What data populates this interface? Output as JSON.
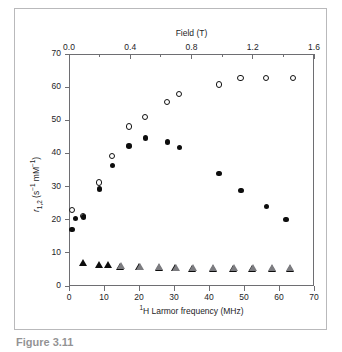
{
  "figure": {
    "caption": "Figure 3.11"
  },
  "chart_data": {
    "type": "scatter",
    "title": "",
    "xlabel": "¹H Larmor frequency (MHz)",
    "ylabel": "r₁,₂ (s⁻¹ mM⁻¹)",
    "top_axis_label": "Field (T)",
    "xlim": [
      0,
      70
    ],
    "ylim": [
      0,
      70
    ],
    "top_xlim": [
      0.0,
      1.6
    ],
    "xticks": [
      0,
      10,
      20,
      30,
      40,
      50,
      60,
      70
    ],
    "xtick_labels": [
      "0",
      "10",
      "20",
      "30",
      "40",
      "50",
      "60",
      "70"
    ],
    "yticks": [
      0,
      10,
      20,
      30,
      40,
      50,
      60,
      70
    ],
    "ytick_labels": [
      "0",
      "10",
      "20",
      "30",
      "40",
      "50",
      "60",
      "70"
    ],
    "top_xticks": [
      0.0,
      0.4,
      0.8,
      1.2,
      1.6
    ],
    "top_xtick_labels": [
      "0.0",
      "0.4",
      "0.8",
      "1.2",
      "1.6"
    ],
    "top_minor_xticks": [
      0.2,
      0.6,
      1.0,
      1.4
    ],
    "grid": false,
    "legend": "none",
    "series": [
      {
        "name": "open-circles",
        "marker": "open circle",
        "color": "#111111",
        "points": [
          [
            0.9,
            23.0
          ],
          [
            3.9,
            21.0
          ],
          [
            8.6,
            31.2
          ],
          [
            12.3,
            39.3
          ],
          [
            17.1,
            48.1
          ],
          [
            21.7,
            50.9
          ],
          [
            28.0,
            55.6
          ],
          [
            31.5,
            57.9
          ],
          [
            42.8,
            60.8
          ],
          [
            49.0,
            62.8
          ],
          [
            56.3,
            62.8
          ],
          [
            64.1,
            62.8
          ]
        ]
      },
      {
        "name": "filled-circles",
        "marker": "filled circle",
        "color": "#0d0d0d",
        "points": [
          [
            0.9,
            17.0
          ],
          [
            1.8,
            20.4
          ],
          [
            4.1,
            20.8
          ],
          [
            8.7,
            29.3
          ],
          [
            12.4,
            36.3
          ],
          [
            17.2,
            42.2
          ],
          [
            21.8,
            44.6
          ],
          [
            28.1,
            43.5
          ],
          [
            31.6,
            41.8
          ],
          [
            42.9,
            34.0
          ],
          [
            49.1,
            28.8
          ],
          [
            56.4,
            24.0
          ],
          [
            62.0,
            20.1
          ]
        ]
      },
      {
        "name": "filled-triangles",
        "marker": "filled triangle",
        "color": "#0d0d0d",
        "points": [
          [
            4.0,
            7.2
          ],
          [
            8.6,
            6.6
          ],
          [
            11.2,
            6.6
          ],
          [
            14.6,
            6.0
          ],
          [
            20.1,
            5.8
          ],
          [
            25.6,
            5.6
          ],
          [
            30.3,
            5.5
          ],
          [
            35.1,
            5.4
          ],
          [
            41.0,
            5.4
          ],
          [
            46.8,
            5.4
          ],
          [
            52.3,
            5.4
          ],
          [
            57.9,
            5.3
          ],
          [
            63.0,
            5.3
          ]
        ]
      },
      {
        "name": "open-triangles",
        "marker": "open triangle",
        "color": "#7c7c80",
        "points": [
          [
            14.8,
            6.2
          ],
          [
            20.3,
            6.0
          ],
          [
            25.8,
            5.8
          ],
          [
            30.5,
            5.7
          ],
          [
            35.3,
            5.6
          ],
          [
            41.2,
            5.6
          ],
          [
            47.0,
            5.6
          ],
          [
            52.5,
            5.6
          ],
          [
            58.1,
            5.5
          ],
          [
            63.2,
            5.5
          ]
        ]
      }
    ]
  }
}
